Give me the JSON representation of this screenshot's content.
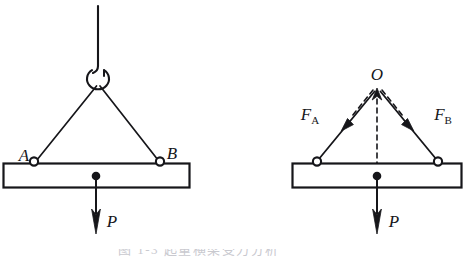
{
  "figure": {
    "background_color": "#ffffff",
    "stroke_color": "#16161a",
    "width": 473,
    "height": 257
  },
  "left_diagram": {
    "name": "physical-sketch",
    "hoist_cable": {
      "label": "",
      "x": 98,
      "top_y": 6,
      "bottom_y": 70
    },
    "hook": {
      "label": "hook",
      "center_x": 98,
      "center_y": 79,
      "radius_x": 11,
      "radius_y": 10
    },
    "attachment_left": {
      "label": "A",
      "x": 34,
      "y": 162
    },
    "attachment_right": {
      "label": "B",
      "x": 161,
      "y": 162
    },
    "beam": {
      "x": 3,
      "y": 163,
      "width": 187,
      "height": 25
    },
    "load": {
      "label": "P",
      "arrow_x": 96,
      "arrow_top_y": 176,
      "arrow_bottom_y": 233
    }
  },
  "right_diagram": {
    "name": "free-body-diagram",
    "apex": {
      "label": "O",
      "x": 377,
      "y": 83
    },
    "force_left": {
      "label": "F",
      "subscript": "A",
      "from_x": 318,
      "from_y": 161,
      "to_x": 374,
      "to_y": 92
    },
    "force_right": {
      "label": "F",
      "subscript": "B",
      "from_x": 437,
      "from_y": 161,
      "to_x": 381,
      "to_y": 92
    },
    "resultant_dashed": {
      "label": "",
      "x": 377,
      "top_y": 88,
      "bottom_y": 176
    },
    "beam": {
      "x": 292,
      "y": 163,
      "width": 170,
      "height": 25
    },
    "load": {
      "label": "P",
      "arrow_x": 377,
      "arrow_top_y": 176,
      "arrow_bottom_y": 233
    }
  },
  "labels": {
    "A": "A",
    "B": "B",
    "O": "O",
    "P_left": "P",
    "P_right": "P",
    "F_A_base": "F",
    "F_A_sub": "A",
    "F_B_base": "F",
    "F_B_sub": "B"
  },
  "caption": {
    "text": "图 1-3    起重横梁受力分析"
  }
}
